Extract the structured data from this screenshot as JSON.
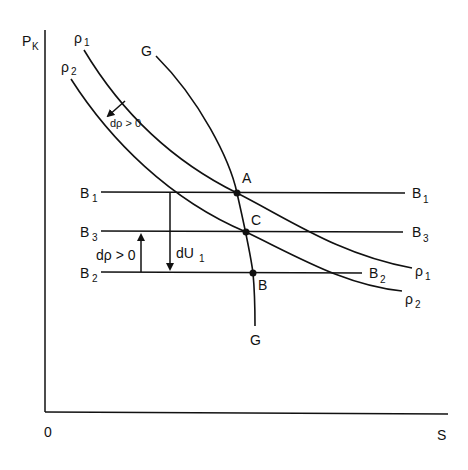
{
  "diagram": {
    "axes": {
      "y_label": "P",
      "y_label_sub": "K",
      "x_label": "S",
      "origin_label": "0"
    },
    "curves": {
      "rho1": {
        "label": "ρ",
        "sub": "1",
        "end_label": "ρ",
        "end_sub": "1"
      },
      "rho2": {
        "label": "ρ",
        "sub": "2",
        "end_label": "ρ",
        "end_sub": "2"
      },
      "G": {
        "label": "G",
        "end_label": "G"
      }
    },
    "lines": {
      "B1": {
        "label": "B",
        "sub": "1",
        "end_label": "B",
        "end_sub": "1"
      },
      "B3": {
        "label": "B",
        "sub": "3",
        "end_label": "B",
        "end_sub": "3"
      },
      "B2": {
        "label": "B",
        "sub": "2",
        "end_label": "B",
        "end_sub": "2"
      }
    },
    "points": {
      "A": "A",
      "C": "C",
      "B": "B"
    },
    "annotations": {
      "shift_arrow": "dρ > 0",
      "d_rho_arrow": "dρ > 0",
      "dU1_main": "dU",
      "dU1_sub": "1"
    }
  }
}
